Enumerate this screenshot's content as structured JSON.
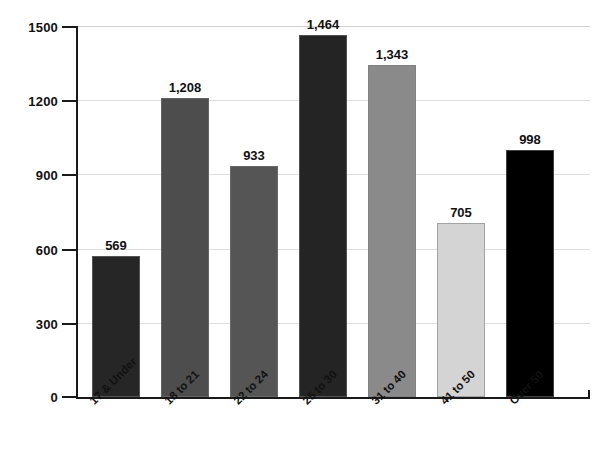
{
  "chart_data": {
    "type": "bar",
    "title": "",
    "subtitle": "",
    "xlabel": "",
    "ylabel": "",
    "categories": [
      "17 & Under",
      "18 to 21",
      "22 to 24",
      "25 to 30",
      "31 to 40",
      "41 to 50",
      "Over 50"
    ],
    "values": [
      569,
      1208,
      933,
      1464,
      1343,
      705,
      998
    ],
    "value_labels": [
      "569",
      "1,208",
      "933",
      "1,464",
      "1,343",
      "705",
      "998"
    ],
    "bar_colors": [
      "#262626",
      "#4d4d4d",
      "#555555",
      "#242424",
      "#8a8a8a",
      "#d4d4d4",
      "#000000"
    ],
    "ylim": [
      0,
      1500
    ],
    "yticks": [
      0,
      300,
      600,
      900,
      1200,
      1500
    ],
    "ytick_labels": [
      "0",
      "300",
      "600",
      "900",
      "1200",
      "1500"
    ],
    "grid": true,
    "grid_color": "#dedede",
    "legend": null,
    "axis_color": "#1a1a1a",
    "background": "#ffffff"
  },
  "axis": {
    "y": {
      "ticks": [
        {
          "label": "1500",
          "value": 1500
        },
        {
          "label": "1200",
          "value": 1200
        },
        {
          "label": "900",
          "value": 900
        },
        {
          "label": "600",
          "value": 600
        },
        {
          "label": "300",
          "value": 300
        },
        {
          "label": "0",
          "value": 0
        }
      ]
    }
  },
  "bars": [
    {
      "category": "17 & Under",
      "value": 569,
      "label": "569",
      "color": "#262626"
    },
    {
      "category": "18 to 21",
      "value": 1208,
      "label": "1,208",
      "color": "#4d4d4d"
    },
    {
      "category": "22 to 24",
      "value": 933,
      "label": "933",
      "color": "#555555"
    },
    {
      "category": "25 to 30",
      "value": 1464,
      "label": "1,464",
      "color": "#242424"
    },
    {
      "category": "31 to 40",
      "value": 1343,
      "label": "1,343",
      "color": "#8a8a8a"
    },
    {
      "category": "41 to 50",
      "value": 705,
      "label": "705",
      "color": "#d4d4d4"
    },
    {
      "category": "Over 50",
      "value": 998,
      "label": "998",
      "color": "#000000"
    }
  ]
}
